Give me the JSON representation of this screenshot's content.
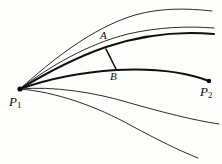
{
  "figure": {
    "background_color": "#fdfdfc",
    "stroke_color": "#1a1a1a",
    "labels": {
      "p1": {
        "base": "P",
        "sub": "1"
      },
      "p2": {
        "base": "P",
        "sub": "2"
      },
      "a": "A",
      "b": "B"
    },
    "points": [
      {
        "name": "P1",
        "x": 20,
        "y": 89,
        "marked": true
      },
      {
        "name": "P2",
        "x": 209,
        "y": 81,
        "marked": true
      },
      {
        "name": "A",
        "x": 106,
        "y": 47,
        "marked": false
      },
      {
        "name": "B",
        "x": 116,
        "y": 70,
        "marked": false
      }
    ],
    "curves": [
      {
        "name": "outer-upper-curve",
        "weight": "thin",
        "path": "M20,89 C52,60 92,28 135,15 C160,8 186,8 212,11"
      },
      {
        "name": "upper-curve",
        "weight": "thin",
        "path": "M20,89 C50,66 88,44 128,34 C158,27 188,26 214,28"
      },
      {
        "name": "curve-through-a",
        "weight": "thick",
        "path": "M20,89 C48,72 80,56 106,47 C142,35 180,31 214,34"
      },
      {
        "name": "curve-through-b-to-p2",
        "weight": "thick",
        "path": "M20,89 C48,79 84,72 116,70 C155,68 188,73 209,81"
      },
      {
        "name": "lower-curve",
        "weight": "thin",
        "path": "M20,89 C52,86 94,92 130,103 C162,112 192,120 219,124"
      },
      {
        "name": "outer-lower-curve",
        "weight": "thin",
        "path": "M20,89 C56,92 96,106 132,126 C158,140 178,150 198,158"
      }
    ],
    "segments": [
      {
        "name": "chord-a-b",
        "x1": 106,
        "y1": 49,
        "x2": 116,
        "y2": 69
      }
    ]
  }
}
